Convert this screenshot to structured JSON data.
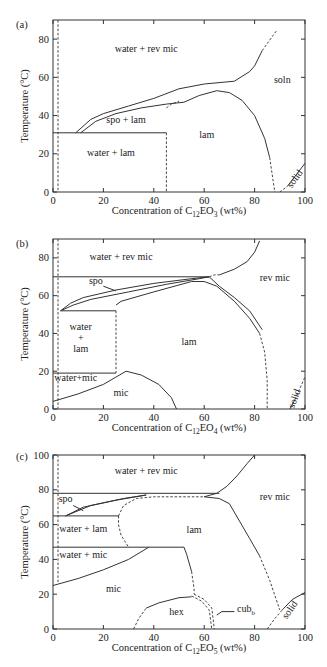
{
  "chart_data": [
    {
      "panel": "(a)",
      "type": "line",
      "title": "",
      "xlabel": "Concentration of C12EO3 (wt%)",
      "xlabel_parts": {
        "pre": "Concentration of C",
        "sub1": "12",
        "mid": "EO",
        "sub2": "3",
        "post": " (wt%)"
      },
      "ylabel": "Temperature (°C)",
      "xlim": [
        0,
        100
      ],
      "ylim": [
        0,
        90
      ],
      "xticks": [
        0,
        20,
        40,
        60,
        80,
        100
      ],
      "yticks": [
        0,
        20,
        40,
        60,
        80
      ],
      "grid": false,
      "regions": [
        {
          "label": "water + rev mic",
          "x": 37,
          "y": 73
        },
        {
          "label": "soln",
          "x": 91,
          "y": 57
        },
        {
          "label": "spo + lam",
          "x": 29,
          "y": 36
        },
        {
          "label": "lam",
          "x": 61,
          "y": 28
        },
        {
          "label": "water + lam",
          "x": 23,
          "y": 19
        },
        {
          "label": "solid",
          "x": 97,
          "y": 6,
          "rotate": -55
        }
      ],
      "boundaries": [
        {
          "style": "solid",
          "points": [
            [
              9,
              31
            ],
            [
              15,
              38
            ],
            [
              20,
              41
            ],
            [
              30,
              45
            ],
            [
              40,
              49
            ],
            [
              50,
              54
            ],
            [
              60,
              56.5
            ],
            [
              72,
              58
            ],
            [
              78,
              63
            ],
            [
              80,
              66
            ],
            [
              83,
              74
            ]
          ]
        },
        {
          "style": "dashed",
          "points": [
            [
              83,
              74
            ],
            [
              89,
              85
            ]
          ]
        },
        {
          "style": "solid",
          "points": [
            [
              11,
              31
            ],
            [
              17,
              37
            ],
            [
              25,
              41
            ],
            [
              35,
              44
            ],
            [
              45,
              46
            ],
            [
              52,
              47
            ]
          ]
        },
        {
          "style": "solid",
          "points": [
            [
              52,
              47
            ],
            [
              58,
              50.5
            ],
            [
              65,
              53
            ],
            [
              70,
              52
            ],
            [
              75,
              48
            ],
            [
              80,
              40
            ],
            [
              84,
              28
            ],
            [
              86,
              18
            ]
          ]
        },
        {
          "style": "dashed",
          "points": [
            [
              86,
              18
            ],
            [
              88,
              0
            ]
          ]
        },
        {
          "style": "dashed",
          "points": [
            [
              45,
              44
            ],
            [
              47,
              46
            ],
            [
              50,
              47.5
            ]
          ]
        },
        {
          "style": "solid",
          "points": [
            [
              0,
              31
            ],
            [
              45,
              31
            ]
          ]
        },
        {
          "style": "dashed",
          "points": [
            [
              45,
              31
            ],
            [
              45,
              0
            ]
          ]
        },
        {
          "style": "dashed",
          "points": [
            [
              2,
              90
            ],
            [
              2,
              0
            ]
          ]
        },
        {
          "style": "dashed",
          "points": [
            [
              90,
              0
            ],
            [
              93,
              3
            ]
          ]
        },
        {
          "style": "solid",
          "points": [
            [
              93,
              3
            ],
            [
              100,
              15
            ]
          ]
        }
      ]
    },
    {
      "panel": "(b)",
      "type": "line",
      "title": "",
      "xlabel": "Concentration of C12EO4 (wt%)",
      "xlabel_parts": {
        "pre": "Concentration of C",
        "sub1": "12",
        "mid": "EO",
        "sub2": "4",
        "post": " (wt%)"
      },
      "ylabel": "Temperature (°C)",
      "xlim": [
        0,
        100
      ],
      "ylim": [
        0,
        90
      ],
      "xticks": [
        0,
        20,
        40,
        60,
        80,
        100
      ],
      "yticks": [
        0,
        20,
        40,
        60,
        80
      ],
      "grid": false,
      "regions": [
        {
          "label": "water + rev mic",
          "x": 27,
          "y": 79
        },
        {
          "label": "rev mic",
          "x": 88,
          "y": 68
        },
        {
          "label": "spo",
          "x": 17,
          "y": 66
        },
        {
          "label": "water",
          "x": 11,
          "y": 42
        },
        {
          "label": "+",
          "x": 11,
          "y": 36
        },
        {
          "label": "lam",
          "x": 11,
          "y": 30
        },
        {
          "label": "lam",
          "x": 54,
          "y": 34
        },
        {
          "label": "water+mic",
          "x": 9,
          "y": 15
        },
        {
          "label": "mic",
          "x": 27,
          "y": 7
        },
        {
          "label": "solid",
          "x": 97,
          "y": 5,
          "rotate": -70
        }
      ],
      "boundaries": [
        {
          "style": "solid",
          "points": [
            [
              0,
              70
            ],
            [
              62,
              70
            ]
          ]
        },
        {
          "style": "solid",
          "points": [
            [
              3,
              52
            ],
            [
              7,
              56
            ],
            [
              12,
              59
            ],
            [
              25,
              63
            ],
            [
              40,
              66.5
            ],
            [
              55,
              69
            ],
            [
              62,
              70
            ]
          ]
        },
        {
          "style": "solid",
          "points": [
            [
              3,
              52
            ],
            [
              8,
              55
            ],
            [
              15,
              58
            ],
            [
              30,
              62
            ],
            [
              45,
              66
            ],
            [
              58,
              69
            ],
            [
              62,
              70
            ]
          ]
        },
        {
          "style": "solid",
          "points": [
            [
              25,
              55
            ],
            [
              27,
              57
            ],
            [
              40,
              62
            ],
            [
              55,
              67.5
            ],
            [
              60,
              67.5
            ],
            [
              65,
              65
            ],
            [
              72,
              57
            ],
            [
              78,
              48
            ],
            [
              82,
              40
            ]
          ]
        },
        {
          "style": "solid",
          "points": [
            [
              62,
              70
            ],
            [
              66,
              65
            ],
            [
              72,
              59
            ],
            [
              78,
              52
            ],
            [
              83,
              42
            ]
          ]
        },
        {
          "style": "dashed",
          "points": [
            [
              82,
              40
            ],
            [
              84,
              30
            ],
            [
              85,
              15
            ],
            [
              85,
              0
            ]
          ]
        },
        {
          "style": "solid",
          "points": [
            [
              66,
              71
            ],
            [
              72,
              74
            ],
            [
              77,
              78
            ],
            [
              80,
              83
            ],
            [
              82,
              89
            ]
          ]
        },
        {
          "style": "dashed",
          "points": [
            [
              62,
              70
            ],
            [
              64,
              71
            ],
            [
              66,
              71
            ]
          ]
        },
        {
          "style": "solid",
          "points": [
            [
              3,
              52
            ],
            [
              25,
              52
            ]
          ]
        },
        {
          "style": "dashed",
          "points": [
            [
              25,
              52
            ],
            [
              25,
              19
            ]
          ]
        },
        {
          "style": "solid",
          "points": [
            [
              0,
              19
            ],
            [
              25,
              19
            ]
          ]
        },
        {
          "style": "solid",
          "points": [
            [
              0,
              4
            ],
            [
              10,
              8
            ],
            [
              20,
              13
            ],
            [
              29,
              20
            ]
          ]
        },
        {
          "style": "solid",
          "points": [
            [
              29,
              20
            ],
            [
              35,
              18
            ],
            [
              42,
              13
            ],
            [
              47,
              6
            ],
            [
              49,
              0
            ]
          ]
        },
        {
          "style": "dashed",
          "points": [
            [
              2,
              90
            ],
            [
              2,
              0
            ]
          ]
        },
        {
          "style": "solid",
          "points": [
            [
              94,
              0
            ],
            [
              96,
              5
            ]
          ]
        },
        {
          "style": "dashed",
          "points": [
            [
              96,
              5
            ],
            [
              100,
              17
            ]
          ]
        }
      ]
    },
    {
      "panel": "(c)",
      "type": "line",
      "title": "",
      "xlabel": "Concentration of C12EO5 (wt%)",
      "xlabel_parts": {
        "pre": "Concentration of C",
        "sub1": "12",
        "mid": "EO",
        "sub2": "5",
        "post": " (wt%)"
      },
      "ylabel": "Temperature (°C)",
      "xlim": [
        0,
        100
      ],
      "ylim": [
        0,
        100
      ],
      "xticks": [
        0,
        20,
        40,
        60,
        80,
        100
      ],
      "yticks": [
        0,
        20,
        40,
        60,
        80,
        100
      ],
      "grid": false,
      "regions": [
        {
          "label": "water + rev mic",
          "x": 37,
          "y": 89
        },
        {
          "label": "rev mic",
          "x": 88,
          "y": 74
        },
        {
          "label": "spo",
          "x": 5,
          "y": 73
        },
        {
          "label": "water + lam",
          "x": 12,
          "y": 56
        },
        {
          "label": "lam",
          "x": 56,
          "y": 55
        },
        {
          "label": "water + mic",
          "x": 12,
          "y": 41
        },
        {
          "label": "mic",
          "x": 24,
          "y": 21
        },
        {
          "label": "hex",
          "x": 49,
          "y": 8
        },
        {
          "label": "cubb",
          "x": 73,
          "y": 10
        },
        {
          "label": "solid",
          "x": 95,
          "y": 10,
          "rotate": -55
        }
      ],
      "boundaries": [
        {
          "style": "solid",
          "points": [
            [
              0,
              78
            ],
            [
              66,
              78
            ]
          ]
        },
        {
          "style": "solid",
          "points": [
            [
              5,
              65
            ],
            [
              12,
              70
            ],
            [
              25,
              74
            ],
            [
              37,
              77
            ]
          ]
        },
        {
          "style": "solid",
          "points": [
            [
              5,
              65
            ],
            [
              15,
              71
            ],
            [
              28,
              75
            ],
            [
              37,
              77
            ]
          ]
        },
        {
          "style": "solid",
          "points": [
            [
              0,
              65
            ],
            [
              26,
              65
            ]
          ]
        },
        {
          "style": "dashed",
          "points": [
            [
              26,
              65
            ],
            [
              26,
              60
            ],
            [
              27,
              54
            ],
            [
              30,
              47
            ]
          ]
        },
        {
          "style": "dashed",
          "points": [
            [
              26,
              65
            ],
            [
              28,
              71
            ],
            [
              33,
              75
            ],
            [
              40,
              76
            ],
            [
              60,
              76
            ]
          ]
        },
        {
          "style": "solid",
          "points": [
            [
              60,
              76
            ],
            [
              66,
              75
            ],
            [
              70,
              72
            ],
            [
              74,
              62
            ],
            [
              78,
              52
            ],
            [
              82,
              42
            ]
          ]
        },
        {
          "style": "dashed",
          "points": [
            [
              82,
              42
            ],
            [
              86,
              28
            ],
            [
              90,
              11
            ]
          ]
        },
        {
          "style": "solid",
          "points": [
            [
              60,
              76
            ],
            [
              65,
              78
            ],
            [
              69,
              82
            ],
            [
              73,
              88
            ],
            [
              77,
              95
            ],
            [
              80,
              100
            ]
          ]
        },
        {
          "style": "solid",
          "points": [
            [
              0,
              47
            ],
            [
              52,
              47
            ]
          ]
        },
        {
          "style": "solid",
          "points": [
            [
              0,
              25
            ],
            [
              10,
              29
            ],
            [
              20,
              34
            ],
            [
              30,
              40
            ],
            [
              38,
              47
            ]
          ]
        },
        {
          "style": "solid",
          "points": [
            [
              52,
              47
            ],
            [
              53,
              43
            ],
            [
              55,
              33
            ]
          ]
        },
        {
          "style": "dashed",
          "points": [
            [
              55,
              33
            ],
            [
              56,
              23
            ],
            [
              56,
              20
            ]
          ]
        },
        {
          "style": "dashed",
          "points": [
            [
              56,
              20
            ],
            [
              60,
              17
            ],
            [
              63,
              12
            ],
            [
              64,
              0
            ]
          ]
        },
        {
          "style": "dashed",
          "points": [
            [
              55,
              19
            ],
            [
              59,
              16
            ],
            [
              62,
              11
            ],
            [
              63,
              0
            ]
          ]
        },
        {
          "style": "dashed",
          "points": [
            [
              32,
              0
            ],
            [
              34,
              6
            ],
            [
              37,
              12
            ]
          ]
        },
        {
          "style": "solid",
          "points": [
            [
              37,
              12
            ],
            [
              42,
              15
            ],
            [
              50,
              18
            ],
            [
              55,
              18.5
            ]
          ]
        },
        {
          "style": "dashed",
          "points": [
            [
              85,
              0
            ],
            [
              88,
              6
            ],
            [
              91,
              11
            ]
          ]
        },
        {
          "style": "solid",
          "points": [
            [
              91,
              11
            ],
            [
              95,
              17
            ],
            [
              100,
              21
            ]
          ]
        },
        {
          "style": "dashed",
          "points": [
            [
              2,
              100
            ],
            [
              2,
              27
            ]
          ]
        }
      ]
    }
  ],
  "panels": [
    {
      "label": "(a)"
    },
    {
      "label": "(b)"
    },
    {
      "label": "(c)"
    }
  ]
}
